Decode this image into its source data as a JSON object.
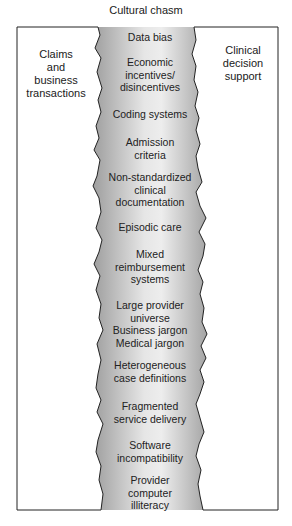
{
  "title": "Cultural chasm",
  "left_panel": {
    "label": "Claims\nand\nbusiness\ntransactions"
  },
  "right_panel": {
    "label": "Clinical\ndecision\nsupport"
  },
  "chasm_items": [
    {
      "text": "Data bias",
      "top": 31
    },
    {
      "text": "Economic\nincentives/\ndisincentives",
      "top": 56
    },
    {
      "text": "Coding systems",
      "top": 108
    },
    {
      "text": "Admission\ncriteria",
      "top": 136
    },
    {
      "text": "Non-standardized\nclinical\ndocumentation",
      "top": 171
    },
    {
      "text": "Episodic care",
      "top": 221
    },
    {
      "text": "Mixed\nreimbursement\nsystems",
      "top": 248
    },
    {
      "text": "Large provider\nuniverse\nBusiness jargon\nMedical jargon",
      "top": 299
    },
    {
      "text": "Heterogeneous\ncase definitions",
      "top": 359
    },
    {
      "text": "Fragmented\nservice delivery",
      "top": 400
    },
    {
      "text": "Software\nincompatibility",
      "top": 439
    },
    {
      "text": "Provider\ncomputer\nilliteracy",
      "top": 474
    }
  ],
  "colors": {
    "chasm_dark": "#a8a8a8",
    "chasm_light": "#ececec",
    "outline": "#222222"
  }
}
